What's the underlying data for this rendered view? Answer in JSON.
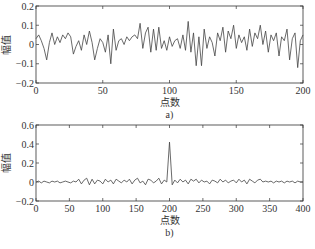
{
  "chart_data": [
    {
      "type": "line",
      "panel": "a)",
      "caption": "a)",
      "title": "",
      "xlabel": "点数",
      "ylabel": "幅值",
      "xlim": [
        0,
        200
      ],
      "ylim": [
        -0.2,
        0.2
      ],
      "xticks": [
        0,
        50,
        100,
        150,
        200
      ],
      "xtick_labels": [
        "0",
        "50",
        "100",
        "150",
        "200"
      ],
      "yticks": [
        -0.2,
        -0.1,
        0,
        0.1,
        0.2
      ],
      "ytick_labels": [
        "−0.2",
        "−0.1",
        "0",
        "0.1",
        "0.2"
      ],
      "grid": false,
      "box": {
        "left": 36,
        "top": 6,
        "right": 303,
        "bottom": 83
      },
      "series": [
        {
          "name": "noise signal",
          "color": "#444444",
          "x_start": 0,
          "x_step": 2,
          "values": [
            0.03,
            0.05,
            0.02,
            -0.02,
            -0.08,
            0.01,
            0.06,
            0.0,
            0.04,
            0.01,
            0.05,
            0.03,
            0.06,
            0.04,
            -0.05,
            -0.01,
            0.02,
            -0.03,
            0.05,
            0.0,
            0.07,
            0.01,
            -0.08,
            -0.02,
            0.03,
            0.01,
            -0.04,
            0.05,
            -0.1,
            0.08,
            -0.03,
            0.02,
            0.03,
            0.0,
            0.04,
            0.02,
            0.04,
            0.05,
            0.03,
            0.11,
            -0.02,
            0.06,
            0.09,
            -0.04,
            0.08,
            -0.03,
            0.09,
            -0.02,
            0.02,
            -0.03,
            0.04,
            -0.01,
            0.02,
            0.03,
            -0.02,
            0.05,
            -0.03,
            0.12,
            -0.04,
            0.06,
            -0.11,
            0.04,
            -0.11,
            0.08,
            -0.02,
            0.04,
            0.01,
            -0.06,
            0.06,
            0.02,
            0.09,
            -0.04,
            0.07,
            0.03,
            0.1,
            -0.02,
            0.05,
            0.01,
            0.04,
            -0.03,
            0.08,
            -0.01,
            0.06,
            0.03,
            0.1,
            0.0,
            0.07,
            -0.04,
            0.05,
            0.02,
            0.06,
            -0.06,
            0.04,
            0.02,
            0.08,
            -0.08,
            0.03,
            0.06,
            -0.12,
            0.02,
            0.05
          ]
        }
      ]
    },
    {
      "type": "line",
      "panel": "b)",
      "caption": "b)",
      "title": "",
      "xlabel": "点数",
      "ylabel": "幅值",
      "xlim": [
        0,
        400
      ],
      "ylim": [
        -0.2,
        0.6
      ],
      "xticks": [
        0,
        50,
        100,
        150,
        200,
        250,
        300,
        350,
        400
      ],
      "xtick_labels": [
        "0",
        "50",
        "100",
        "150",
        "200",
        "250",
        "300",
        "350",
        "400"
      ],
      "yticks": [
        -0.2,
        0,
        0.2,
        0.4,
        0.6
      ],
      "ytick_labels": [
        "−0.2",
        "0",
        "0.2",
        "0.4",
        "0.6"
      ],
      "grid": false,
      "box": {
        "left": 36,
        "top": 125,
        "right": 303,
        "bottom": 201
      },
      "series": [
        {
          "name": "correlation output",
          "color": "#444444",
          "peak": {
            "x": 200,
            "y": 0.42
          },
          "x_start": 0,
          "x_step": 4,
          "values": [
            0.0,
            0.01,
            -0.01,
            0.01,
            0.0,
            -0.01,
            0.01,
            0.0,
            0.01,
            -0.01,
            0.0,
            0.01,
            0.0,
            -0.01,
            0.01,
            0.0,
            0.03,
            -0.02,
            0.02,
            0.04,
            -0.03,
            0.03,
            -0.02,
            0.02,
            0.01,
            -0.02,
            0.03,
            0.0,
            0.02,
            -0.02,
            0.03,
            0.01,
            -0.01,
            0.02,
            0.0,
            0.03,
            -0.02,
            0.02,
            0.04,
            -0.01,
            0.01,
            -0.03,
            0.03,
            0.02,
            -0.01,
            0.01,
            0.04,
            -0.02,
            0.02,
            0.0,
            0.42,
            -0.03,
            0.02,
            -0.01,
            0.03,
            0.0,
            0.02,
            -0.02,
            0.03,
            0.01,
            0.03,
            -0.01,
            0.02,
            0.0,
            0.01,
            -0.02,
            0.02,
            0.01,
            -0.01,
            0.03,
            0.0,
            0.02,
            -0.01,
            0.01,
            0.02,
            -0.01,
            0.03,
            0.0,
            0.02,
            -0.02,
            0.03,
            0.01,
            -0.01,
            0.02,
            0.03,
            0.0,
            0.01,
            0.0,
            0.01,
            -0.01,
            0.01,
            0.0,
            0.01,
            -0.01,
            0.01,
            0.0,
            0.01,
            -0.01,
            0.01,
            0.0,
            0.0
          ]
        }
      ]
    }
  ]
}
